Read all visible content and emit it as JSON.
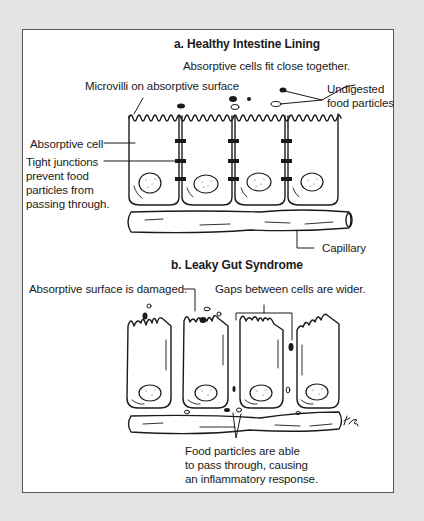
{
  "panel_a": {
    "title": "a. Healthy Intestine Lining",
    "caption": "Absorptive cells fit close together.",
    "labels": {
      "microvilli": "Microvilli on absorptive surface",
      "undigested_1": "Undigested",
      "undigested_2": "food particles",
      "absorptive_cell": "Absorptive cell",
      "tight_1": "Tight junctions",
      "tight_2": "prevent food",
      "tight_3": "particles from",
      "tight_4": "passing through.",
      "capillary": "Capillary"
    }
  },
  "panel_b": {
    "title": "b. Leaky Gut Syndrome",
    "labels": {
      "damaged": "Absorptive surface is damaged.",
      "gaps": "Gaps between cells are wider.",
      "food_1": "Food particles are able",
      "food_2": "to pass through, causing",
      "food_3": "an inflammatory response."
    },
    "signature": "KB"
  },
  "colors": {
    "background": "#e4e4e4",
    "panel": "#ffffff",
    "line": "#1a1a1a"
  }
}
